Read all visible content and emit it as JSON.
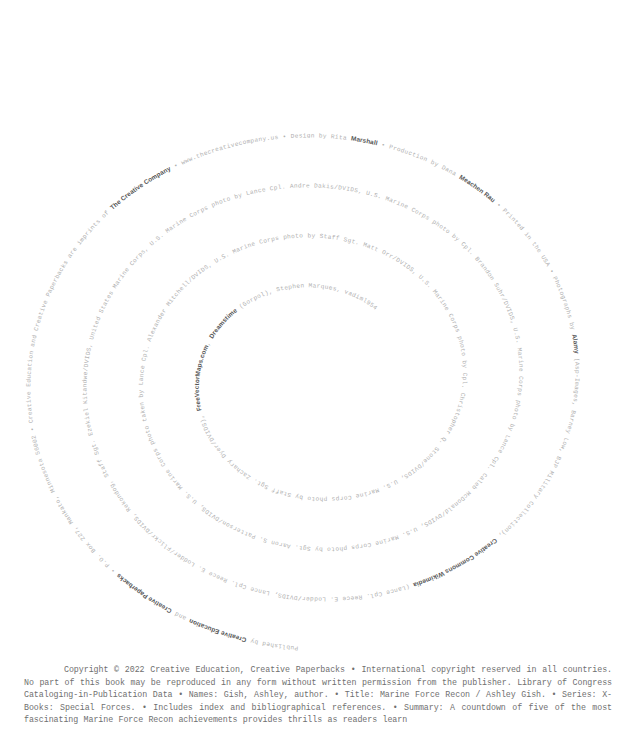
{
  "page": {
    "background_color": "#ffffff",
    "text_color": "#9a9a9a",
    "emphasis_color": "#555555"
  },
  "spiral": {
    "description": "credits-text-arranged-as-inward-spiral",
    "turns": 5,
    "segments": [
      {
        "text": "Published by ",
        "bold": false
      },
      {
        "text": "Creative Education",
        "bold": true
      },
      {
        "text": " and ",
        "bold": false
      },
      {
        "text": "Creative Paperbacks",
        "bold": true
      },
      {
        "text": " • P.O. Box 227, Mankato, Minnesota 56002 • Creative Education and Creative Paperbacks are imprints of ",
        "bold": false
      },
      {
        "text": "The Creative Company",
        "bold": true
      },
      {
        "text": " • www.thecreativecompany.us • Design by Rita ",
        "bold": false
      },
      {
        "text": "Marshall",
        "bold": true
      },
      {
        "text": " • Production by Dana ",
        "bold": false
      },
      {
        "text": "Meachen Rau",
        "bold": true
      },
      {
        "text": " • Printed in the USA • Photographs by ",
        "bold": false
      },
      {
        "text": "Alamy",
        "bold": true
      },
      {
        "text": " (Asp-Images, Barney Low, BJP Military Collection), ",
        "bold": false
      },
      {
        "text": "Creative Commons Wikimedia",
        "bold": true
      },
      {
        "text": " (Lance Cpl. Reece E. Lodder/DVIDS, Lance Cpl. Reece E. Lodder/Flickr/DVIDS, Rekondog, Staff Sgt. Ezekiel Kitandwe/DVIDS, United States Marine Corps, U.S. Marine Corps photo by Lance Cpl. Andre Dakis/DVIDS, U.S. Marine Corps photo by Cpl. Brandon Suhr/DVIDS, U.S. Marine Corps photo by Lance Cpl. Caleb McDonald/DVIDS, U.S. Marine Corps photo by Sgt. Aaron S. Patterson/DVIDS, U.S. Marine Corps photo taken by Lance Cpl. Alexander Mitchell/DVIDS, U.S. Marine Corps photo by Staff Sgt. Matt Orr/DVIDS, U.S. Marine Corps photo by Cpl. Christopher Q. Stone/DVIDS, U.S. Marine Corps photo by Staff Sgt. Zachary Dyer/DVIDS), ",
        "bold": false
      },
      {
        "text": "FreeVectorMaps.com",
        "bold": true
      },
      {
        "text": ", ",
        "bold": false
      },
      {
        "text": "Dreamstime",
        "bold": true
      },
      {
        "text": " (Gorpol), Stephen Marques, vadiml954",
        "bold": false
      }
    ],
    "plain_text": "Published by Creative Education and Creative Paperbacks • P.O. Box 227, Mankato, Minnesota 56002 • Creative Education and Creative Paperbacks are imprints of The Creative Company • www.thecreativecompany.us • Design by Rita Marshall • Production by Dana Meachen Rau • Printed in the USA • Photographs by Alamy (Asp-Images, Barney Low, BJP Military Collection), Creative Commons Wikimedia (Lance Cpl. Reece E. Lodder/DVIDS, Lance Cpl. Reece E. Lodder/Flickr/DVIDS, Rekondog, Staff Sgt. Ezekiel Kitandwe/DVIDS, United States Marine Corps, U.S. Marine Corps photo by Lance Cpl. Andre Dakis/DVIDS, U.S. Marine Corps photo by Cpl. Brandon Suhr/DVIDS, U.S. Marine Corps photo by Lance Cpl. Caleb McDonald/DVIDS, U.S. Marine Corps photo by Sgt. Aaron S. Patterson/DVIDS, U.S. Marine Corps photo taken by Lance Cpl. Alexander Mitchell/DVIDS, U.S. Marine Corps photo by Staff Sgt. Matt Orr/DVIDS, U.S. Marine Corps photo by Cpl. Christopher Q. Stone/DVIDS, U.S. Marine Corps photo by Staff Sgt. Zachary Dyer/DVIDS), FreeVectorMaps.com, Dreamstime (Gorpol), Stephen Marques, vadiml954"
  },
  "colophon": {
    "text": "Copyright © 2022 Creative Education, Creative Paperbacks • International copyright reserved in all countries. No part of this book may be reproduced in any form without written permission from the publisher. Library of Congress Cataloging-in-Publication Data • Names: Gish, Ashley, author. • Title: Marine Force Recon / Ashley Gish. • Series: X-Books: Special Forces. • Includes index and bibliographical references. • Summary: A countdown of five of the most fascinating Marine Force Recon achievements provides thrills as readers learn"
  }
}
